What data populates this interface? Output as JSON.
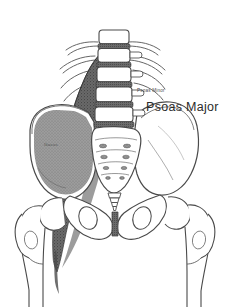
{
  "figure": {
    "background_color": "#ffffff",
    "width": 236,
    "height": 307
  },
  "labels": {
    "main": "Psoas Major",
    "minor": "Psoas Minor",
    "iliacus": "Iliacus"
  },
  "colors": {
    "background": "#ffffff",
    "bone_outline": "#4a4a4a",
    "bone_fill": "#ffffff",
    "muscle_psoas": "#5a5a5a",
    "muscle_iliacus": "#6b6b6b",
    "disc_shade": "#5e5e5e",
    "label_text": "#2b2b2b"
  },
  "structures": [
    {
      "name": "lumbar-vertebrae",
      "count": 5,
      "description": "Lumbar vertebral bodies L1-L5 with transverse processes"
    },
    {
      "name": "intervertebral-discs",
      "count": 5,
      "description": "Shaded intervertebral discs between lumbar bodies"
    },
    {
      "name": "sacrum",
      "description": "Sacrum with four pairs of sacral foramina"
    },
    {
      "name": "coccyx",
      "description": "Coccyx below sacrum"
    },
    {
      "name": "ilium-left",
      "description": "Left ilium with iliac fossa shaded by iliacus"
    },
    {
      "name": "ilium-right",
      "description": "Right ilium, unshaded outline"
    },
    {
      "name": "obturator-foramen-left",
      "description": "Left obturator foramen"
    },
    {
      "name": "obturator-foramen-right",
      "description": "Right obturator foramen"
    },
    {
      "name": "pubic-symphysis",
      "description": "Pubic symphysis at midline"
    },
    {
      "name": "femur-left",
      "description": "Left femur head, neck and greater trochanter"
    },
    {
      "name": "femur-right",
      "description": "Right femur head, neck and greater trochanter"
    },
    {
      "name": "psoas-major-muscle",
      "description": "Shaded psoas major muscle from lumbar spine to lesser trochanter"
    }
  ]
}
